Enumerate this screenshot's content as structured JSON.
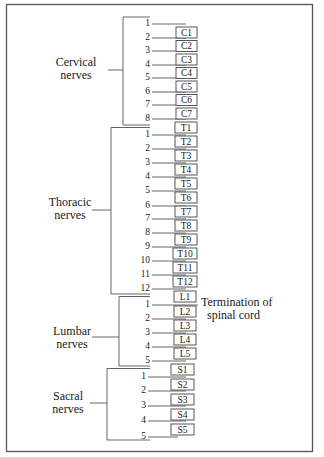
{
  "diagram": {
    "title": "",
    "groups": [
      {
        "id": "cervical",
        "label_line1": "Cervical",
        "label_line2": "nerves",
        "nerves": [
          "1",
          "2",
          "3",
          "4",
          "5",
          "6",
          "7",
          "8"
        ],
        "vertebrae": [
          "C1",
          "C2",
          "C3",
          "C4",
          "C5",
          "C6",
          "C7"
        ]
      },
      {
        "id": "thoracic",
        "label_line1": "Thoracic",
        "label_line2": "nerves",
        "nerves": [
          "1",
          "2",
          "3",
          "4",
          "5",
          "6",
          "7",
          "8",
          "9",
          "10",
          "11",
          "12"
        ],
        "vertebrae": [
          "T1",
          "T2",
          "T3",
          "T4",
          "T5",
          "T6",
          "T7",
          "T8",
          "T9",
          "T10",
          "T11",
          "T12"
        ]
      },
      {
        "id": "lumbar",
        "label_line1": "Lumbar",
        "label_line2": "nerves",
        "nerves": [
          "1",
          "2",
          "3",
          "4",
          "5"
        ],
        "vertebrae": [
          "L1",
          "L2",
          "L3",
          "L4",
          "L5"
        ]
      },
      {
        "id": "sacral",
        "label_line1": "Sacral",
        "label_line2": "nerves",
        "nerves": [
          "1",
          "2",
          "3",
          "4",
          "5"
        ],
        "vertebrae": [
          "S1",
          "S2",
          "S3",
          "S4",
          "S5"
        ]
      }
    ],
    "annotation": {
      "line1": "Termination of",
      "line2": "spinal cord",
      "points_to": "L1"
    }
  }
}
